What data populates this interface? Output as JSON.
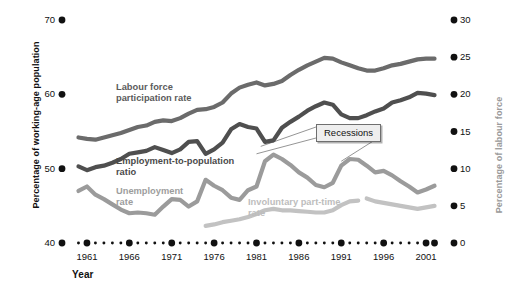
{
  "chart_data": {
    "type": "line",
    "title": "",
    "xlabel": "Year",
    "ylabel": "Percentage of working-age population",
    "ylabel_right": "Percentage of labour force",
    "xlim": [
      1959,
      2003
    ],
    "ylim": [
      40,
      70
    ],
    "ylim_right": [
      0,
      30
    ],
    "grid": false,
    "legend_position": "inline-labels",
    "x_ticks": [
      "1961",
      "1966",
      "1971",
      "1976",
      "1981",
      "1986",
      "1991",
      "1996",
      "2001"
    ],
    "x_tick_values": [
      1961,
      1966,
      1971,
      1976,
      1981,
      1986,
      1991,
      1996,
      2001
    ],
    "y_ticks_left": [
      "40",
      "50",
      "60",
      "70"
    ],
    "y_tick_values_left": [
      40,
      50,
      60,
      70
    ],
    "y_ticks_right": [
      "0",
      "5",
      "10",
      "15",
      "20",
      "25",
      "30"
    ],
    "y_tick_values_right": [
      0,
      5,
      10,
      15,
      20,
      25,
      30
    ],
    "annotations": [
      {
        "text": "Recessions",
        "x": 1989,
        "y": 56.5,
        "leader_targets": [
          {
            "x": 1981.5,
            "y": 53.0
          },
          {
            "x": 1990.5,
            "y": 55.2
          },
          {
            "x": 1981.0,
            "y": 12.0
          },
          {
            "x": 1991.0,
            "y": 11.0
          }
        ]
      }
    ],
    "series": [
      {
        "name": "Labour force participation rate",
        "axis": "left",
        "color": "#6b6b6b",
        "label_color": "#5b5b5b",
        "x": [
          1960,
          1961,
          1962,
          1963,
          1964,
          1965,
          1966,
          1967,
          1968,
          1969,
          1970,
          1971,
          1972,
          1973,
          1974,
          1975,
          1976,
          1977,
          1978,
          1979,
          1980,
          1981,
          1982,
          1983,
          1984,
          1985,
          1986,
          1987,
          1988,
          1989,
          1990,
          1991,
          1992,
          1993,
          1994,
          1995,
          1996,
          1997,
          1998,
          1999,
          2000,
          2001,
          2002
        ],
        "values": [
          54.2,
          54.0,
          53.9,
          54.2,
          54.5,
          54.8,
          55.2,
          55.6,
          55.8,
          56.3,
          56.5,
          56.4,
          56.8,
          57.4,
          57.9,
          58.0,
          58.3,
          58.9,
          60.1,
          60.9,
          61.3,
          61.6,
          61.2,
          61.4,
          61.8,
          62.6,
          63.3,
          63.9,
          64.4,
          64.9,
          64.8,
          64.3,
          63.9,
          63.5,
          63.2,
          63.2,
          63.5,
          63.9,
          64.1,
          64.4,
          64.7,
          64.8,
          64.8
        ]
      },
      {
        "name": "Employment-to-population ratio",
        "axis": "left",
        "color": "#4f4f4f",
        "label_color": "#4a4a4a",
        "x": [
          1960,
          1961,
          1962,
          1963,
          1964,
          1965,
          1966,
          1967,
          1968,
          1969,
          1970,
          1971,
          1972,
          1973,
          1974,
          1975,
          1976,
          1977,
          1978,
          1979,
          1980,
          1981,
          1982,
          1983,
          1984,
          1985,
          1986,
          1987,
          1988,
          1989,
          1990,
          1991,
          1992,
          1993,
          1994,
          1995,
          1996,
          1997,
          1998,
          1999,
          2000,
          2001,
          2002
        ],
        "values": [
          50.3,
          49.8,
          50.2,
          50.4,
          50.8,
          51.3,
          52.0,
          52.2,
          52.4,
          52.9,
          52.5,
          52.1,
          52.6,
          53.6,
          53.7,
          52.0,
          52.6,
          53.5,
          55.3,
          56.0,
          55.6,
          55.4,
          53.6,
          53.8,
          55.5,
          56.3,
          57.0,
          57.8,
          58.4,
          58.9,
          58.6,
          57.3,
          56.8,
          56.8,
          57.2,
          57.7,
          58.1,
          58.9,
          59.2,
          59.6,
          60.2,
          60.1,
          59.9
        ]
      },
      {
        "name": "Unemployment rate",
        "axis": "right",
        "color": "#9b9b9b",
        "label_color": "#9d9d9d",
        "x": [
          1960,
          1961,
          1962,
          1963,
          1964,
          1965,
          1966,
          1967,
          1968,
          1969,
          1970,
          1971,
          1972,
          1973,
          1974,
          1975,
          1976,
          1977,
          1978,
          1979,
          1980,
          1981,
          1982,
          1983,
          1984,
          1985,
          1986,
          1987,
          1988,
          1989,
          1990,
          1991,
          1992,
          1993,
          1994,
          1995,
          1996,
          1997,
          1998,
          1999,
          2000,
          2001,
          2002
        ],
        "values": [
          7.0,
          7.6,
          6.5,
          5.9,
          5.2,
          4.5,
          4.0,
          4.1,
          4.0,
          3.8,
          4.9,
          5.9,
          5.8,
          4.9,
          5.6,
          8.5,
          7.7,
          7.1,
          6.1,
          5.8,
          7.1,
          7.6,
          11.0,
          11.9,
          11.3,
          10.5,
          9.5,
          8.8,
          7.8,
          7.5,
          8.1,
          10.4,
          11.3,
          11.2,
          10.4,
          9.5,
          9.7,
          9.1,
          8.3,
          7.6,
          6.8,
          7.2,
          7.7
        ]
      },
      {
        "name": "Involuntary part-time rate",
        "axis": "right",
        "color": "#c2c2c2",
        "label_color": "#bdbdbd",
        "break_after_x": 1993,
        "x": [
          1975,
          1976,
          1977,
          1978,
          1979,
          1980,
          1981,
          1982,
          1983,
          1984,
          1985,
          1986,
          1987,
          1988,
          1989,
          1990,
          1991,
          1992,
          1993,
          1994,
          1995,
          1996,
          1997,
          1998,
          1999,
          2000,
          2001,
          2002
        ],
        "values": [
          2.3,
          2.5,
          2.8,
          3.0,
          3.2,
          3.5,
          3.9,
          4.4,
          4.6,
          4.4,
          4.4,
          4.3,
          4.2,
          4.1,
          4.1,
          4.4,
          5.1,
          5.6,
          5.7,
          6.0,
          5.6,
          5.4,
          5.2,
          5.0,
          4.8,
          4.6,
          4.8,
          5.0
        ]
      }
    ]
  },
  "axes": {
    "left_title": "Percentage of working-age population",
    "right_title": "Percentage of labour force",
    "x_title": "Year"
  },
  "labels": {
    "lfpr": "Labour force\nparticipation rate",
    "epop": "Employment-to-population\nratio",
    "unemp": "Unemployment\nrate",
    "ipt": "Involuntary part-time\nrate",
    "recessions": "Recessions"
  }
}
